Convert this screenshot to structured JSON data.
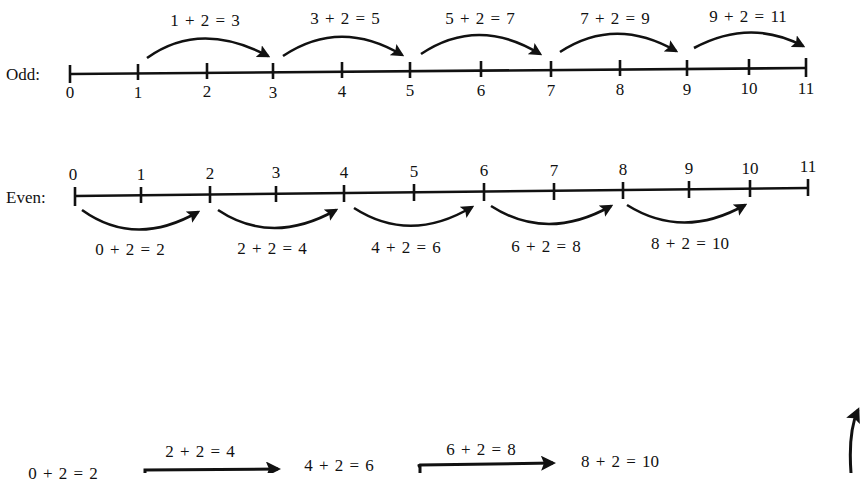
{
  "odd": {
    "label": "Odd:",
    "ticks": [
      "0",
      "1",
      "2",
      "3",
      "4",
      "5",
      "6",
      "7",
      "8",
      "9",
      "10",
      "11"
    ],
    "jumps": [
      "1 + 2 = 3",
      "3 + 2 = 5",
      "5 + 2 = 7",
      "7 + 2 = 9",
      "9 + 2 = 11"
    ]
  },
  "even": {
    "label": "Even:",
    "ticks": [
      "0",
      "1",
      "2",
      "3",
      "4",
      "5",
      "6",
      "7",
      "8",
      "9",
      "10",
      "11"
    ],
    "jumps": [
      "0 + 2 = 2",
      "2 + 2 = 4",
      "4 + 2 = 6",
      "6 + 2 = 8",
      "8 + 2 = 10"
    ]
  },
  "bottom_chain": {
    "items": [
      "0 + 2 = 2",
      "2 + 2 = 4",
      "4 + 2 = 6",
      "6 + 2 = 8",
      "8 + 2 = 10"
    ]
  }
}
